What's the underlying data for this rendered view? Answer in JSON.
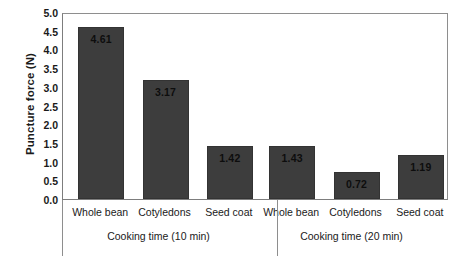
{
  "chart_data": {
    "type": "bar",
    "title": "",
    "xlabel": "",
    "ylabel": "Puncture force (N)",
    "ylim": [
      0.0,
      5.0
    ],
    "ytick_labels": [
      "5.0",
      "4.5",
      "4.0",
      "3.5",
      "3.0",
      "2.5",
      "2.0",
      "1.5",
      "1.0",
      "0.5",
      "0.0"
    ],
    "ytick_values": [
      5.0,
      4.5,
      4.0,
      3.5,
      3.0,
      2.5,
      2.0,
      1.5,
      1.0,
      0.5,
      0.0
    ],
    "grid": false,
    "legend": "none",
    "bar_color": "#3d3d3d",
    "categories": [
      "Whole bean",
      "Cotyledons",
      "Seed coat"
    ],
    "groups": [
      {
        "label": "Cooking time (10 min)",
        "bars": [
          {
            "category": "Whole bean",
            "value": 4.61,
            "label": "4.61"
          },
          {
            "category": "Cotyledons",
            "value": 3.17,
            "label": "3.17"
          },
          {
            "category": "Seed coat",
            "value": 1.42,
            "label": "1.42"
          }
        ]
      },
      {
        "label": "Cooking time (20 min)",
        "bars": [
          {
            "category": "Whole bean",
            "value": 1.43,
            "label": "1.43"
          },
          {
            "category": "Cotyledons",
            "value": 0.72,
            "label": "0.72"
          },
          {
            "category": "Seed coat",
            "value": 1.19,
            "label": "1.19"
          }
        ]
      }
    ],
    "series": [
      {
        "name": "Cooking time (10 min)",
        "values": [
          4.61,
          3.17,
          1.42
        ]
      },
      {
        "name": "Cooking time (20 min)",
        "values": [
          1.43,
          0.72,
          1.19
        ]
      }
    ]
  }
}
